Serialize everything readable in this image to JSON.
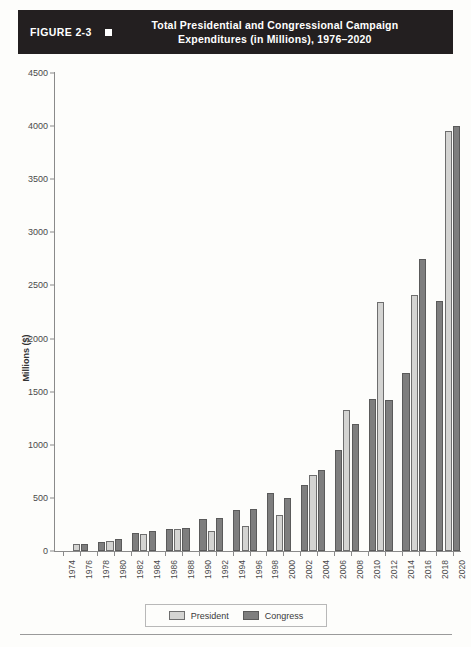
{
  "figure": {
    "number_label": "FIGURE 2-3",
    "marker_icon": "square-marker-icon",
    "title_line1": "Total Presidential and Congressional Campaign",
    "title_line2": "Expenditures (in Millions), 1976–2020",
    "header_background": "#231f20",
    "header_text_color": "#ffffff"
  },
  "legend": {
    "items": [
      {
        "label": "President",
        "color": "#d4d4d2"
      },
      {
        "label": "Congress",
        "color": "#7e7e7e"
      }
    ]
  },
  "chart_data": {
    "type": "bar",
    "title": "Total Presidential and Congressional Campaign Expenditures (in Millions), 1976–2020",
    "xlabel": "",
    "ylabel": "Millions ($)",
    "ylim": [
      0,
      4500
    ],
    "ytick_step": 500,
    "yticks": [
      0,
      500,
      1000,
      1500,
      2000,
      2500,
      3000,
      3500,
      4000,
      4500
    ],
    "grid": false,
    "legend_position": "bottom-center",
    "axis_tick_years": [
      1974,
      1976,
      1978,
      1980,
      1982,
      1984,
      1986,
      1988,
      1990,
      1992,
      1994,
      1996,
      1998,
      2000,
      2002,
      2004,
      2006,
      2008,
      2010,
      2012,
      2014,
      2016,
      2018,
      2020
    ],
    "categories": [
      1976,
      1978,
      1980,
      1982,
      1984,
      1986,
      1988,
      1990,
      1992,
      1994,
      1996,
      1998,
      2000,
      2002,
      2004,
      2006,
      2008,
      2010,
      2012,
      2014,
      2016,
      2018,
      2020
    ],
    "series": [
      {
        "name": "President",
        "color": "#d4d4d2",
        "values": [
          66,
          0,
          92,
          0,
          160,
          0,
          210,
          0,
          192,
          0,
          240,
          0,
          343,
          0,
          718,
          0,
          1325,
          0,
          2340,
          0,
          2410,
          0,
          3950
        ]
      },
      {
        "name": "Congress",
        "color": "#7e7e7e",
        "values": [
          66,
          85,
          115,
          170,
          190,
          210,
          215,
          300,
          315,
          390,
          400,
          545,
          500,
          620,
          760,
          955,
          1200,
          1430,
          1420,
          1680,
          2750,
          2350,
          4000
        ]
      }
    ],
    "series_note": "Presidential expenditures occur only in presidential election years (even, divisible by 4); congressional expenditures occur every even year.",
    "data_points": [
      {
        "year": 1976,
        "president": 66,
        "congress": 66
      },
      {
        "year": 1978,
        "president": null,
        "congress": 85
      },
      {
        "year": 1980,
        "president": 92,
        "congress": 115
      },
      {
        "year": 1982,
        "president": null,
        "congress": 170
      },
      {
        "year": 1984,
        "president": 160,
        "congress": 190
      },
      {
        "year": 1986,
        "president": null,
        "congress": 210
      },
      {
        "year": 1988,
        "president": 210,
        "congress": 215
      },
      {
        "year": 1990,
        "president": null,
        "congress": 300
      },
      {
        "year": 1992,
        "president": 192,
        "congress": 315
      },
      {
        "year": 1994,
        "president": null,
        "congress": 390
      },
      {
        "year": 1996,
        "president": 240,
        "congress": 400
      },
      {
        "year": 1998,
        "president": null,
        "congress": 545
      },
      {
        "year": 2000,
        "president": 343,
        "congress": 500
      },
      {
        "year": 2002,
        "president": null,
        "congress": 620
      },
      {
        "year": 2004,
        "president": 718,
        "congress": 760
      },
      {
        "year": 2006,
        "president": null,
        "congress": 955
      },
      {
        "year": 2008,
        "president": 1325,
        "congress": 1200
      },
      {
        "year": 2010,
        "president": null,
        "congress": 1430
      },
      {
        "year": 2012,
        "president": 2340,
        "congress": 1420
      },
      {
        "year": 2014,
        "president": null,
        "congress": 1680
      },
      {
        "year": 2016,
        "president": 2410,
        "congress": 2750
      },
      {
        "year": 2018,
        "president": null,
        "congress": 2350
      },
      {
        "year": 2020,
        "president": 3950,
        "congress": 4000
      }
    ]
  }
}
